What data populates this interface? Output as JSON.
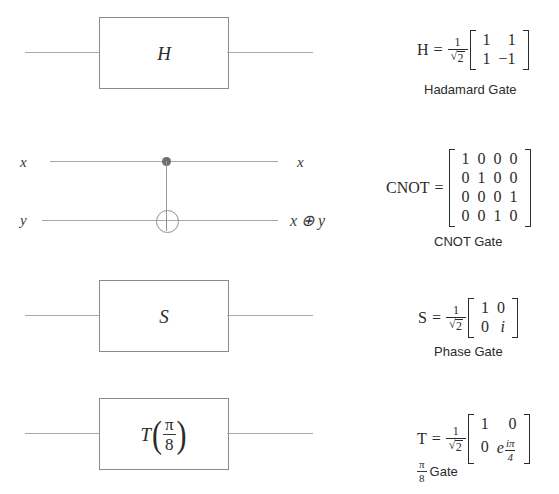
{
  "diagram": {
    "background_color": "#ffffff",
    "wire_color": "#a8a8a8",
    "box_border_color": "#8a8a8a"
  },
  "rows": [
    {
      "id": "hadamard",
      "gate_symbol": "H",
      "formula_name": "H",
      "equals": "=",
      "scalar_numerator": "1",
      "scalar_denominator_radicand": "2",
      "matrix": [
        [
          "1",
          "1"
        ],
        [
          "1",
          "−1"
        ]
      ],
      "caption": "Hadamard Gate"
    },
    {
      "id": "cnot",
      "input_labels": [
        "x",
        "y"
      ],
      "output_labels": [
        "x",
        "x ⊕ y"
      ],
      "control_icon": "control-dot-icon",
      "target_icon": "xor-target-icon",
      "formula_name": "CNOT",
      "equals": "=",
      "matrix": [
        [
          "1",
          "0",
          "0",
          "0"
        ],
        [
          "0",
          "1",
          "0",
          "0"
        ],
        [
          "0",
          "0",
          "0",
          "1"
        ],
        [
          "0",
          "0",
          "1",
          "0"
        ]
      ],
      "caption": "CNOT Gate"
    },
    {
      "id": "phase",
      "gate_symbol": "S",
      "formula_name": "S",
      "equals": "=",
      "scalar_numerator": "1",
      "scalar_denominator_radicand": "2",
      "matrix": [
        [
          "1",
          "0"
        ],
        [
          "0",
          "i"
        ]
      ],
      "caption": "Phase Gate"
    },
    {
      "id": "t-gate",
      "gate_symbol": "T",
      "gate_arg_numerator": "π",
      "gate_arg_denominator": "8",
      "formula_name": "T",
      "equals": "=",
      "scalar_numerator": "1",
      "scalar_denominator_radicand": "2",
      "matrix": [
        [
          "1",
          "0"
        ],
        [
          "0",
          "e"
        ]
      ],
      "exponent_numerator": "iπ",
      "exponent_denominator": "4",
      "caption_fraction_numerator": "π",
      "caption_fraction_denominator": "8",
      "caption": "Gate"
    }
  ]
}
